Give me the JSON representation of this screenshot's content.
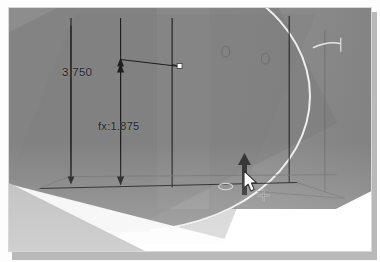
{
  "app": {
    "type": "cad-3d-viewport",
    "description": "CAD modeling viewport showing an extruded cylindrical part with sketch dimensions being dragged"
  },
  "viewport": {
    "background_color": "#ffffff",
    "model_color": "#8d8d8d",
    "shaded_color": "#7b7b7b",
    "highlight_color": "#efefef",
    "line_color": "#1d1d1d"
  },
  "dimensions": [
    {
      "id": "overall-height",
      "label": "3.750",
      "driving": true,
      "value": "3.750",
      "position": {
        "x": 53,
        "y": 58
      }
    },
    {
      "id": "equation-height",
      "label": "fx:1.875",
      "prefix": "fx:",
      "value": "1.875",
      "driven_by_equation": true,
      "position": {
        "x": 89,
        "y": 112
      }
    }
  ],
  "geometry": {
    "features": [
      {
        "name": "cylinder-body",
        "shape": "cylinder"
      },
      {
        "name": "box-wireframe",
        "shape": "rectangular-prism"
      },
      {
        "name": "reference-plane",
        "shape": "plane"
      }
    ],
    "holes": [
      {
        "name": "hole-1",
        "x": 218,
        "y": 44,
        "r": 4
      },
      {
        "name": "hole-2",
        "x": 258,
        "y": 51,
        "r": 4
      }
    ],
    "sketch_points": [
      {
        "name": "endpoint-handle",
        "x": 172,
        "y": 59
      }
    ]
  },
  "icons": {
    "drag_arrow": "up-arrow-drag-handle",
    "cursor": "mouse-pointer",
    "move_badge": "move-crosshair"
  },
  "interaction": {
    "state": "dragging",
    "handle": "extrude-direction-arrow",
    "cursor_position": {
      "x": 235,
      "y": 163
    }
  }
}
